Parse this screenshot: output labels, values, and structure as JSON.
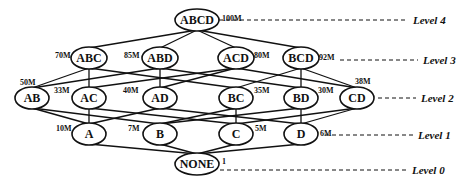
{
  "diagram": {
    "type": "lattice",
    "colors": {
      "stroke": "#111111",
      "background": "#ffffff",
      "text": "#111111"
    },
    "levels": [
      {
        "id": "level4",
        "label": "Level 4",
        "y": 20,
        "line_x1": 212,
        "line_x2": 408
      },
      {
        "id": "level3",
        "label": "Level 3",
        "y": 60,
        "line_x1": 340,
        "line_x2": 418
      },
      {
        "id": "level2",
        "label": "Level 2",
        "y": 98,
        "line_x1": 378,
        "line_x2": 416
      },
      {
        "id": "level1",
        "label": "Level 1",
        "y": 135,
        "line_x1": 325,
        "line_x2": 413
      },
      {
        "id": "level0",
        "label": "Level 0",
        "y": 170,
        "line_x1": 220,
        "line_x2": 407
      }
    ],
    "nodes": [
      {
        "id": "ABCD",
        "label": "ABCD",
        "size": "100M",
        "level": 4,
        "cx": 197,
        "cy": 20,
        "rx": 22,
        "ry": 11,
        "size_x": 222,
        "size_y": 21
      },
      {
        "id": "ABC",
        "label": "ABC",
        "size": "70M",
        "level": 3,
        "cx": 89,
        "cy": 58,
        "rx": 18,
        "ry": 11,
        "size_x": 55,
        "size_y": 58
      },
      {
        "id": "ABD",
        "label": "ABD",
        "size": "85M",
        "level": 3,
        "cx": 160,
        "cy": 58,
        "rx": 18,
        "ry": 11,
        "size_x": 124,
        "size_y": 58
      },
      {
        "id": "ACD",
        "label": "ACD",
        "size": "80M",
        "level": 3,
        "cx": 236,
        "cy": 58,
        "rx": 18,
        "ry": 11,
        "size_x": 254,
        "size_y": 58
      },
      {
        "id": "BCD",
        "label": "BCD",
        "size": "92M",
        "level": 3,
        "cx": 301,
        "cy": 58,
        "rx": 18,
        "ry": 11,
        "size_x": 319,
        "size_y": 60
      },
      {
        "id": "AB",
        "label": "AB",
        "size": "50M",
        "level": 2,
        "cx": 32,
        "cy": 98,
        "rx": 17,
        "ry": 11,
        "size_x": 20,
        "size_y": 85
      },
      {
        "id": "AC",
        "label": "AC",
        "size": "33M",
        "level": 2,
        "cx": 89,
        "cy": 98,
        "rx": 17,
        "ry": 11,
        "size_x": 54,
        "size_y": 93
      },
      {
        "id": "AD",
        "label": "AD",
        "size": "40M",
        "level": 2,
        "cx": 160,
        "cy": 98,
        "rx": 17,
        "ry": 11,
        "size_x": 123,
        "size_y": 93
      },
      {
        "id": "BC",
        "label": "BC",
        "size": "35M",
        "level": 2,
        "cx": 236,
        "cy": 98,
        "rx": 17,
        "ry": 11,
        "size_x": 254,
        "size_y": 93
      },
      {
        "id": "BD",
        "label": "BD",
        "size": "30M",
        "level": 2,
        "cx": 301,
        "cy": 98,
        "rx": 17,
        "ry": 11,
        "size_x": 318,
        "size_y": 93
      },
      {
        "id": "CD",
        "label": "CD",
        "size": "38M",
        "level": 2,
        "cx": 357,
        "cy": 98,
        "rx": 17,
        "ry": 11,
        "size_x": 355,
        "size_y": 84
      },
      {
        "id": "A",
        "label": "A",
        "size": "10M",
        "level": 1,
        "cx": 89,
        "cy": 134,
        "rx": 17,
        "ry": 11,
        "size_x": 56,
        "size_y": 131
      },
      {
        "id": "B",
        "label": "B",
        "size": "7M",
        "level": 1,
        "cx": 160,
        "cy": 134,
        "rx": 17,
        "ry": 11,
        "size_x": 128,
        "size_y": 131
      },
      {
        "id": "C",
        "label": "C",
        "size": "5M",
        "level": 1,
        "cx": 236,
        "cy": 134,
        "rx": 17,
        "ry": 11,
        "size_x": 255,
        "size_y": 131
      },
      {
        "id": "D",
        "label": "D",
        "size": "6M",
        "level": 1,
        "cx": 301,
        "cy": 134,
        "rx": 17,
        "ry": 11,
        "size_x": 320,
        "size_y": 136
      },
      {
        "id": "NONE",
        "label": "NONE",
        "size": "1",
        "level": 0,
        "cx": 197,
        "cy": 164,
        "rx": 22,
        "ry": 11,
        "size_x": 222,
        "size_y": 164
      }
    ],
    "edges": [
      [
        "ABCD",
        "ABC"
      ],
      [
        "ABCD",
        "ABD"
      ],
      [
        "ABCD",
        "ACD"
      ],
      [
        "ABCD",
        "BCD"
      ],
      [
        "ABC",
        "AB"
      ],
      [
        "ABC",
        "AC"
      ],
      [
        "ABC",
        "BC"
      ],
      [
        "ABD",
        "AB"
      ],
      [
        "ABD",
        "AD"
      ],
      [
        "ABD",
        "BD"
      ],
      [
        "ACD",
        "AC"
      ],
      [
        "ACD",
        "AD"
      ],
      [
        "ACD",
        "CD"
      ],
      [
        "BCD",
        "BC"
      ],
      [
        "BCD",
        "BD"
      ],
      [
        "BCD",
        "CD"
      ],
      [
        "AB",
        "A"
      ],
      [
        "AB",
        "B"
      ],
      [
        "AC",
        "A"
      ],
      [
        "AC",
        "C"
      ],
      [
        "AD",
        "A"
      ],
      [
        "AD",
        "D"
      ],
      [
        "BC",
        "B"
      ],
      [
        "BC",
        "C"
      ],
      [
        "BD",
        "B"
      ],
      [
        "BD",
        "D"
      ],
      [
        "CD",
        "C"
      ],
      [
        "CD",
        "D"
      ],
      [
        "A",
        "NONE"
      ],
      [
        "B",
        "NONE"
      ],
      [
        "C",
        "NONE"
      ],
      [
        "D",
        "NONE"
      ]
    ]
  }
}
